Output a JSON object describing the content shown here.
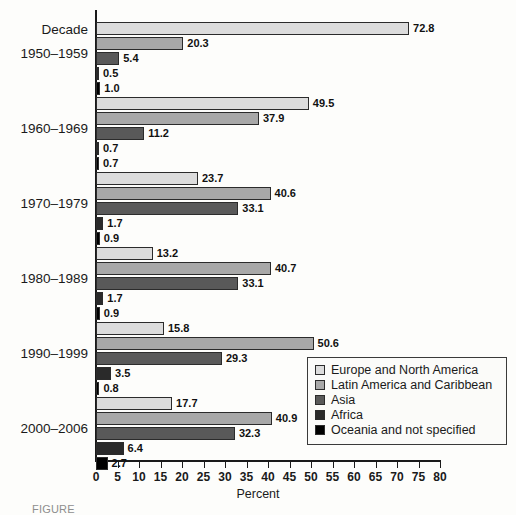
{
  "chart_data": {
    "type": "bar",
    "orientation": "horizontal",
    "title": "",
    "xlabel": "Percent",
    "ylabel": "Decade",
    "xlim": [
      0,
      80
    ],
    "xticks": [
      0,
      5,
      10,
      15,
      20,
      25,
      30,
      35,
      40,
      45,
      50,
      55,
      60,
      65,
      70,
      75,
      80
    ],
    "grid": false,
    "legend_position": "lower-right",
    "categories": [
      "1950–1959",
      "1960–1969",
      "1970–1979",
      "1980–1989",
      "1990–1999",
      "2000–2006"
    ],
    "series": [
      {
        "name": "Europe and North America",
        "color": "#dcdcdc",
        "values": [
          72.8,
          49.5,
          23.7,
          13.2,
          15.8,
          17.7
        ]
      },
      {
        "name": "Latin America and Caribbean",
        "color": "#a8a8a8",
        "values": [
          20.3,
          37.9,
          40.6,
          40.7,
          50.6,
          40.9
        ]
      },
      {
        "name": "Asia",
        "color": "#595959",
        "values": [
          5.4,
          11.2,
          33.1,
          33.1,
          29.3,
          32.3
        ]
      },
      {
        "name": "Africa",
        "color": "#2a2a2a",
        "values": [
          0.5,
          0.7,
          1.7,
          1.7,
          3.5,
          6.4
        ]
      },
      {
        "name": "Oceania and not specified",
        "color": "#000000",
        "values": [
          1.0,
          0.7,
          0.9,
          0.9,
          0.8,
          2.7
        ]
      }
    ]
  },
  "axis": {
    "y_header": "Decade",
    "x_title": "Percent",
    "tick_labels": [
      "0",
      "5",
      "10",
      "15",
      "20",
      "25",
      "30",
      "35",
      "40",
      "45",
      "50",
      "55",
      "60",
      "65",
      "70",
      "75",
      "80"
    ]
  },
  "groups": [
    {
      "label": "1950–1959",
      "bars": [
        {
          "series": "Europe and North America",
          "value": 72.8,
          "value_label": "72.8",
          "style": "s0"
        },
        {
          "series": "Latin America and Caribbean",
          "value": 20.3,
          "value_label": "20.3",
          "style": "s1"
        },
        {
          "series": "Asia",
          "value": 5.4,
          "value_label": "5.4",
          "style": "s2"
        },
        {
          "series": "Africa",
          "value": 0.5,
          "value_label": "0.5",
          "style": "s3"
        },
        {
          "series": "Oceania and not specified",
          "value": 1.0,
          "value_label": "1.0",
          "style": "s4"
        }
      ]
    },
    {
      "label": "1960–1969",
      "bars": [
        {
          "series": "Europe and North America",
          "value": 49.5,
          "value_label": "49.5",
          "style": "s0"
        },
        {
          "series": "Latin America and Caribbean",
          "value": 37.9,
          "value_label": "37.9",
          "style": "s1"
        },
        {
          "series": "Asia",
          "value": 11.2,
          "value_label": "11.2",
          "style": "s2"
        },
        {
          "series": "Africa",
          "value": 0.7,
          "value_label": "0.7",
          "style": "s3"
        },
        {
          "series": "Oceania and not specified",
          "value": 0.7,
          "value_label": "0.7",
          "style": "s4"
        }
      ]
    },
    {
      "label": "1970–1979",
      "bars": [
        {
          "series": "Europe and North America",
          "value": 23.7,
          "value_label": "23.7",
          "style": "s0"
        },
        {
          "series": "Latin America and Caribbean",
          "value": 40.6,
          "value_label": "40.6",
          "style": "s1"
        },
        {
          "series": "Asia",
          "value": 33.1,
          "value_label": "33.1",
          "style": "s2"
        },
        {
          "series": "Africa",
          "value": 1.7,
          "value_label": "1.7",
          "style": "s3"
        },
        {
          "series": "Oceania and not specified",
          "value": 0.9,
          "value_label": "0.9",
          "style": "s4"
        }
      ]
    },
    {
      "label": "1980–1989",
      "bars": [
        {
          "series": "Europe and North America",
          "value": 13.2,
          "value_label": "13.2",
          "style": "s0"
        },
        {
          "series": "Latin America and Caribbean",
          "value": 40.7,
          "value_label": "40.7",
          "style": "s1"
        },
        {
          "series": "Asia",
          "value": 33.1,
          "value_label": "33.1",
          "style": "s2"
        },
        {
          "series": "Africa",
          "value": 1.7,
          "value_label": "1.7",
          "style": "s3"
        },
        {
          "series": "Oceania and not specified",
          "value": 0.9,
          "value_label": "0.9",
          "style": "s4"
        }
      ]
    },
    {
      "label": "1990–1999",
      "bars": [
        {
          "series": "Europe and North America",
          "value": 15.8,
          "value_label": "15.8",
          "style": "s0"
        },
        {
          "series": "Latin America and Caribbean",
          "value": 50.6,
          "value_label": "50.6",
          "style": "s1"
        },
        {
          "series": "Asia",
          "value": 29.3,
          "value_label": "29.3",
          "style": "s2"
        },
        {
          "series": "Africa",
          "value": 3.5,
          "value_label": "3.5",
          "style": "s3"
        },
        {
          "series": "Oceania and not specified",
          "value": 0.8,
          "value_label": "0.8",
          "style": "s4"
        }
      ]
    },
    {
      "label": "2000–2006",
      "bars": [
        {
          "series": "Europe and North America",
          "value": 17.7,
          "value_label": "17.7",
          "style": "s0"
        },
        {
          "series": "Latin America and Caribbean",
          "value": 40.9,
          "value_label": "40.9",
          "style": "s1"
        },
        {
          "series": "Asia",
          "value": 32.3,
          "value_label": "32.3",
          "style": "s2"
        },
        {
          "series": "Africa",
          "value": 6.4,
          "value_label": "6.4",
          "style": "s3"
        },
        {
          "series": "Oceania and not specified",
          "value": 2.7,
          "value_label": "2.7",
          "style": "s4"
        }
      ]
    }
  ],
  "legend": {
    "items": [
      {
        "label": "Europe and North America",
        "style": "s0"
      },
      {
        "label": "Latin America and Caribbean",
        "style": "s1"
      },
      {
        "label": "Asia",
        "style": "s2"
      },
      {
        "label": "Africa",
        "style": "s3"
      },
      {
        "label": "Oceania and not specified",
        "style": "s4"
      }
    ]
  },
  "caption": {
    "text": "FIGURE"
  }
}
